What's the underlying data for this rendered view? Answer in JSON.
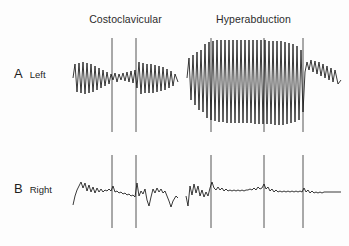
{
  "figure": {
    "panels": [
      {
        "letter": "A",
        "side": "Left"
      },
      {
        "letter": "B",
        "side": "Right"
      }
    ],
    "columns": [
      {
        "title": "Costoclavicular"
      },
      {
        "title": "Hyperabduction"
      }
    ]
  },
  "chart_data": {
    "type": "line",
    "title": "",
    "xlabel": "",
    "ylabel": "",
    "grid": false,
    "legend_position": "none",
    "row_labels": [
      "A Left",
      "B Right"
    ],
    "column_labels": [
      "Costoclavicular",
      "Hyperabduction"
    ],
    "axis_ranges": {
      "x": [
        0,
        349
      ],
      "y_row_a": [
        35,
        130
      ],
      "y_row_b": [
        155,
        225
      ]
    },
    "event_markers": {
      "costoclavicular": [
        112,
        136
      ],
      "hyperabduction": [
        211,
        264,
        303
      ]
    },
    "series": [
      {
        "name": "A Left - Costoclavicular",
        "row": "A",
        "column": "Costoclavicular",
        "baseline_y": 78,
        "x_start": 73,
        "x_end": 178,
        "amplitude_profile": "large regular pulses, damped to low amplitude between markers at x=112 and x=136, recovering after x=136",
        "points": "73,78 75,64 77,92 79,63 81,93 83,62 85,94 87,63 89,93 91,64 93,92 95,66 97,90 99,68 101,88 103,70 105,86 107,72 109,84 111,74 113,80 115,73 117,82 119,74 121,80 123,73 125,81 127,72 129,82 131,71 133,83 135,70 137,88 139,62 141,94 143,63 145,93 147,64 149,93 151,64 153,93 155,65 157,92 159,66 161,91 163,67 165,90 167,69 169,88 171,71 173,86 175,74 178,82"
      },
      {
        "name": "A Left - Hyperabduction",
        "row": "A",
        "column": "Hyperabduction",
        "baseline_y": 78,
        "x_start": 187,
        "x_end": 341,
        "amplitude_profile": "very large oscillations reaching ceiling near y=40 and troughs to y=125; amplitude peaks mid-section then collapses after marker at x=303, recovering to moderate amplitude",
        "points": "187,78 189,58 191,100 193,55 195,105 197,52 199,110 201,50 203,112 205,44 207,118 209,42 211,120 213,41 215,121 217,40 219,122 221,40 223,122 225,40 227,123 229,40 231,123 233,40 235,123 237,40 239,123 241,40 243,123 245,40 247,123 249,40 251,123 253,40 255,124 257,40 259,124 261,40 263,124 265,40 267,124 269,41 271,124 273,41 275,125 277,41 279,125 281,41 283,125 285,42 287,124 289,43 291,123 293,44 295,122 297,46 299,120 301,50 303,112 305,72 307,62 309,70 311,60 313,72 315,61 317,74 319,62 321,76 323,64 325,78 327,66 329,80 331,68 333,82 335,70 338,84 341,80"
      },
      {
        "name": "B Right - Costoclavicular",
        "row": "B",
        "column": "Costoclavicular",
        "baseline_y": 190,
        "x_start": 73,
        "x_end": 178,
        "amplitude_profile": "low-amplitude irregular tracing; brief sharp deflections coincide with event markers at x=112 and x=136",
        "points": "73,205 75,196 77,190 79,186 81,182 83,188 85,183 87,191 89,185 91,192 93,187 95,193 97,188 99,192 101,189 103,192 105,190 107,191 109,189 111,191 113,186 115,192 117,191 119,193 121,192 123,194 125,193 127,195 129,194 131,196 133,195 135,197 137,183 139,196 141,191 143,194 145,189 147,200 149,206 151,197 153,189 155,193 157,188 159,192 161,189 163,193 165,191 167,196 169,201 171,207 173,201 176,196 178,198"
      },
      {
        "name": "B Right - Hyperabduction",
        "row": "B",
        "column": "Hyperabduction",
        "baseline_y": 190,
        "x_start": 186,
        "x_end": 341,
        "amplitude_profile": "nearly flat dampened tracing with small ripples; narrow spikes at markers x=211, x=264, x=303; progressively flattening toward the right",
        "points": "186,196 188,206 190,186 192,195 194,184 196,193 198,186 200,196 202,190 204,197 206,192 208,196 210,188 212,182 214,188 216,190 218,187 220,190 222,188 224,191 226,189 228,191 230,190 232,191 234,190 236,191 238,190 240,191 242,190 244,191 246,190 248,190 250,189 252,190 254,188 256,190 258,187 260,189 262,188 264,184 266,189 268,187 270,191 272,189 274,192 276,190 278,192 280,191 282,192 284,191 286,192 288,191 290,192 292,191 294,192 296,191 298,192 300,191 302,192 304,188 306,192 308,190 310,193 312,191 314,193 316,192 318,193 320,192 322,193 324,192 326,192 328,192 330,192 332,192 334,192 336,192 338,192 341,192"
      }
    ]
  },
  "colors": {
    "trace": "#151515",
    "marker": "#2a2a2a",
    "text": "#1e1e1e",
    "background": "#fdfdfd"
  }
}
